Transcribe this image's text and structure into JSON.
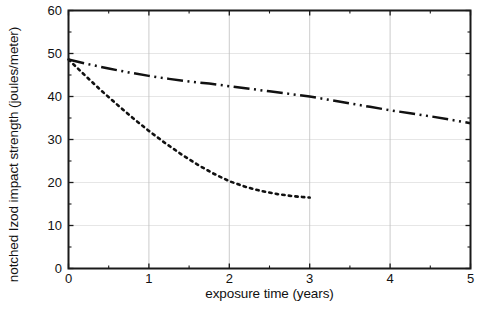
{
  "chart_data": {
    "type": "line",
    "title": "",
    "xlabel": "exposure time (years)",
    "ylabel": "notched Izod impact strength (joules/meter)",
    "xlim": [
      0,
      5
    ],
    "ylim": [
      0,
      60
    ],
    "xticks": [
      0,
      1,
      2,
      3,
      4,
      5
    ],
    "xtick_labels": [
      "0",
      "1",
      "2",
      "3",
      "4",
      "5"
    ],
    "yticks": [
      0,
      10,
      20,
      30,
      40,
      50,
      60
    ],
    "ytick_labels": [
      "0",
      "10",
      "20",
      "30",
      "40",
      "50",
      "60"
    ],
    "xminor_step": 0.5,
    "yminor_step": 5,
    "grid": true,
    "grid_color": "#bfbfbf",
    "legend": "none",
    "axis_color": "#1a1a1a",
    "series": [
      {
        "name": "dash-dot-dot curve",
        "style": "dashdotdot",
        "color": "#111111",
        "x": [
          0.0,
          0.25,
          0.5,
          0.75,
          1.0,
          1.25,
          1.5,
          1.75,
          2.0,
          2.25,
          2.5,
          2.75,
          3.0,
          3.25,
          3.5,
          3.75,
          4.0,
          4.25,
          4.5,
          4.75,
          5.0
        ],
        "y": [
          48.6,
          47.5,
          46.5,
          45.6,
          44.8,
          44.1,
          43.5,
          43.0,
          42.4,
          41.8,
          41.2,
          40.6,
          40.0,
          39.2,
          38.4,
          37.6,
          36.8,
          36.1,
          35.4,
          34.6,
          33.8
        ]
      },
      {
        "name": "dotted curve",
        "style": "dotted",
        "color": "#111111",
        "x": [
          0.0,
          0.2,
          0.4,
          0.6,
          0.8,
          1.0,
          1.2,
          1.4,
          1.6,
          1.8,
          2.0,
          2.2,
          2.4,
          2.6,
          2.8,
          3.0
        ],
        "y": [
          48.6,
          45.0,
          41.5,
          38.2,
          35.0,
          32.0,
          29.2,
          26.6,
          24.2,
          22.1,
          20.3,
          19.0,
          18.0,
          17.3,
          16.8,
          16.5
        ]
      }
    ]
  }
}
